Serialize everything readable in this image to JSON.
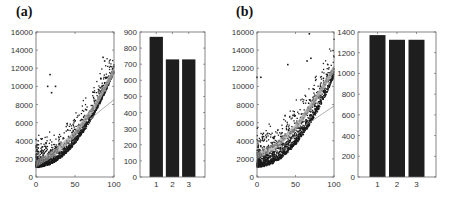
{
  "panels": {
    "a": {
      "label": "(a)"
    },
    "b": {
      "label": "(b)"
    }
  },
  "chart_data": [
    {
      "panel": "(a)",
      "type": "scatter",
      "title": "",
      "xlabel": "",
      "ylabel": "",
      "xlim": [
        0,
        100
      ],
      "ylim": [
        0,
        16000
      ],
      "xticks": [
        0,
        50,
        100
      ],
      "yticks": [
        0,
        2000,
        4000,
        6000,
        8000,
        10000,
        12000,
        14000,
        16000
      ],
      "grid": false,
      "description": "Dense dark scatter cloud rising quadratically from ~1000 at x=0 to ~12000 at x=100, with a lower envelope near 1000-2000 at low x; gray fitted curves overlaid, one lower line diverging to ~8500 at x=100; outliers near x=15-20 at 9500-11500 and x=85-90 near 13000",
      "fit_curves": [
        {
          "name": "upper fits",
          "x": [
            0,
            25,
            50,
            75,
            100
          ],
          "y": [
            1500,
            2800,
            4800,
            7800,
            11800
          ]
        },
        {
          "name": "lower fit",
          "x": [
            70,
            100
          ],
          "y": [
            6500,
            8600
          ]
        }
      ],
      "outliers": [
        [
          15,
          10000
        ],
        [
          18,
          11300
        ],
        [
          20,
          9300
        ],
        [
          25,
          10000
        ],
        [
          86,
          13200
        ],
        [
          88,
          12800
        ]
      ]
    },
    {
      "panel": "(a)",
      "type": "bar",
      "title": "",
      "categories": [
        "1",
        "2",
        "3"
      ],
      "values": [
        870,
        730,
        730
      ],
      "xlabel": "",
      "ylabel": "",
      "ylim": [
        0,
        900
      ],
      "yticks": [
        0,
        100,
        200,
        300,
        400,
        500,
        600,
        700,
        800,
        900
      ],
      "bar_color": "#1e1e1e",
      "grid": false
    },
    {
      "panel": "(b)",
      "type": "scatter",
      "title": "",
      "xlabel": "",
      "ylabel": "",
      "xlim": [
        0,
        100
      ],
      "ylim": [
        0,
        16000
      ],
      "xticks": [
        0,
        50,
        100
      ],
      "yticks": [
        0,
        2000,
        4000,
        6000,
        8000,
        10000,
        12000,
        14000,
        16000
      ],
      "grid": false,
      "description": "Dense dark scatter cloud from ~1000-5000 at low x rising to ~11000 at x=100; many scattered points up to ~11000 at low x; gray fitted curve bundle from ~2500 at x=0 to ~12000 at x=100, one lower line to ~8000; outliers near x=70 at ~15800 and x=65-70 near 13000",
      "fit_curves": [
        {
          "name": "upper fits",
          "x": [
            0,
            25,
            50,
            75,
            100
          ],
          "y": [
            2400,
            3500,
            5500,
            8500,
            12000
          ]
        },
        {
          "name": "lower fit",
          "x": [
            60,
            100
          ],
          "y": [
            5600,
            7900
          ]
        }
      ],
      "outliers": [
        [
          68,
          15800
        ],
        [
          40,
          12400
        ],
        [
          65,
          12800
        ],
        [
          70,
          13100
        ],
        [
          0,
          11000
        ],
        [
          5,
          11000
        ]
      ]
    },
    {
      "panel": "(b)",
      "type": "bar",
      "title": "",
      "categories": [
        "1",
        "2",
        "3"
      ],
      "values": [
        1370,
        1325,
        1325
      ],
      "xlabel": "",
      "ylabel": "",
      "ylim": [
        0,
        1400
      ],
      "yticks": [
        0,
        200,
        400,
        600,
        800,
        1000,
        1200,
        1400
      ],
      "bar_color": "#1e1e1e",
      "grid": false
    }
  ]
}
